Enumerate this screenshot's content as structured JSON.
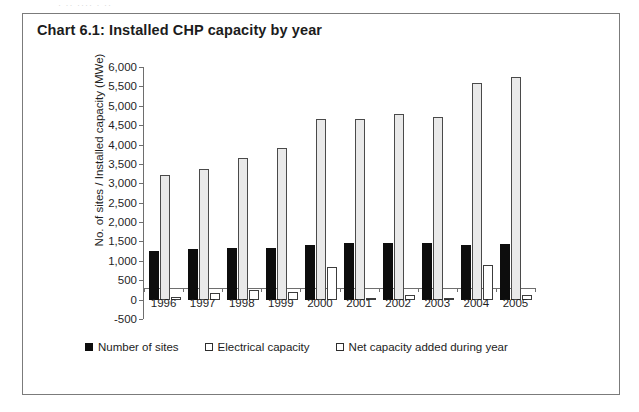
{
  "page": {
    "top_artifact_text": "·  ·· ···· · ··",
    "panel_border_color": "#7b7b7b",
    "background_color": "#ffffff"
  },
  "chart_data": {
    "type": "bar",
    "title": "Chart 6.1: Installed CHP capacity by year",
    "xlabel": "",
    "ylabel": "No. of sites / Installed capacity (MWe)",
    "categories": [
      "1996",
      "1997",
      "1998",
      "1999",
      "2000",
      "2001",
      "2002",
      "2003",
      "2004",
      "2005"
    ],
    "series": [
      {
        "name": "Number of sites",
        "color": "#0d0d0d",
        "style": "filled",
        "values": [
          1250,
          1300,
          1320,
          1330,
          1400,
          1450,
          1450,
          1450,
          1420,
          1440
        ]
      },
      {
        "name": "Electrical capacity",
        "color": "#e9e9e9",
        "style": "hollow-grey",
        "values": [
          3220,
          3370,
          3650,
          3900,
          4650,
          4650,
          4800,
          4700,
          5600,
          5750
        ]
      },
      {
        "name": "Net capacity added during year",
        "color": "#ffffff",
        "style": "hollow",
        "values": [
          80,
          160,
          260,
          200,
          840,
          0,
          120,
          30,
          890,
          120
        ]
      }
    ],
    "ylim": [
      -500,
      6000
    ],
    "yticks": [
      6000,
      5500,
      5000,
      4500,
      4000,
      3500,
      3000,
      2500,
      2000,
      1500,
      1000,
      500,
      0,
      -500
    ],
    "ytick_labels": [
      "6,000",
      "5,500",
      "5,000",
      "4,500",
      "4,000",
      "3,500",
      "3,000",
      "2,500",
      "2,000",
      "1,500",
      "1,000",
      "500",
      "0",
      "-500"
    ],
    "grid": false,
    "legend_position": "bottom"
  }
}
